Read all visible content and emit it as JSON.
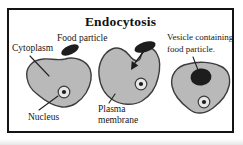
{
  "diagram": {
    "title": "Endocytosis",
    "labels": {
      "cytoplasm": "Cytoplasm",
      "food_particle": "Food particle",
      "nucleus": "Nucleus",
      "plasma_membrane_line1": "Plasma",
      "plasma_membrane_line2": "membrane",
      "vesicle_line1": "Vesicle containing",
      "vesicle_line2": "food particle."
    },
    "colors": {
      "background": "#ffffff",
      "frame_border": "#141414",
      "cell_fill": "#b9b9b9",
      "cell_outline": "#3d3d3d",
      "particle_fill": "#1d1d1d",
      "nucleus_fill": "#e8e8e8",
      "nucleolus_fill": "#1d1d1d",
      "pointer_line": "#222222",
      "text": "#161616"
    }
  }
}
